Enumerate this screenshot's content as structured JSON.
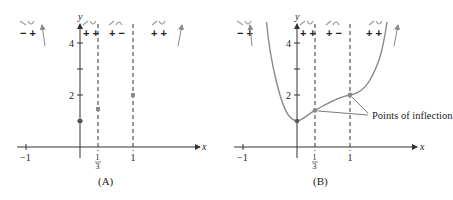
{
  "figure": {
    "function": "f(x) = 3x^4 - 8x^3 + 6x^2 + 1",
    "colors": {
      "axis": "#333333",
      "curve": "#8a8a8a",
      "dashed": "#333333",
      "point": "#8a8a8a",
      "sign_glyph": "#9a9a9a"
    }
  },
  "panels": [
    {
      "caption": "(A)",
      "y_axis_label": "y",
      "x_axis_label": "x",
      "y_ticks": [
        {
          "value": 4,
          "label": "4"
        },
        {
          "value": 3,
          "label": ""
        },
        {
          "value": 2,
          "label": "2"
        },
        {
          "value": 1,
          "label": ""
        }
      ],
      "x_ticks": [
        {
          "value": -1,
          "label": "−1"
        },
        {
          "value": 0.3333,
          "label_num": "1",
          "label_den": "3"
        },
        {
          "value": 1,
          "label": "1"
        }
      ],
      "sign_chart": [
        {
          "region": "x<0",
          "signs": "− +",
          "glyph": "decreasing, concave up"
        },
        {
          "region": "0<x<1/3",
          "signs": "+ +",
          "glyph": "increasing, concave up"
        },
        {
          "region": "1/3<x<1",
          "signs": "+ −",
          "glyph": "increasing, concave down"
        },
        {
          "region": "x>1",
          "signs": "+ +",
          "glyph": "increasing, concave up"
        }
      ],
      "points": [
        {
          "x": 0,
          "y": 1
        },
        {
          "x": 0.3333,
          "y": 1.41
        },
        {
          "x": 1,
          "y": 2
        }
      ]
    },
    {
      "caption": "(B)",
      "y_axis_label": "y",
      "x_axis_label": "x",
      "annotation": "Points of inflection",
      "sign_chart": [
        {
          "region": "x<0",
          "signs": "− +"
        },
        {
          "region": "0<x<1/3",
          "signs": "+ +"
        },
        {
          "region": "1/3<x<1",
          "signs": "+ −"
        },
        {
          "region": "x>1",
          "signs": "+ +"
        }
      ],
      "points": [
        {
          "x": 0,
          "y": 1
        },
        {
          "x": 0.3333,
          "y": 1.41
        },
        {
          "x": 1,
          "y": 2
        }
      ]
    }
  ],
  "labels": {
    "a_caption": "(A)",
    "b_caption": "(B)",
    "y": "y",
    "x": "x",
    "tick_4": "4",
    "tick_2": "2",
    "tick_neg1": "−1",
    "tick_1": "1",
    "frac_num": "1",
    "frac_den": "3",
    "sign_1": "− +",
    "sign_2": "+ +",
    "sign_3": "+ −",
    "sign_4": "+ +",
    "inflection": "Points of inflection"
  }
}
